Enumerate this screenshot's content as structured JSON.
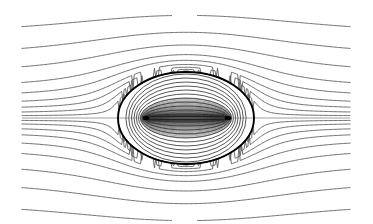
{
  "figure": {
    "title": "",
    "caption": "",
    "background_color": "#ffffff",
    "width": 373,
    "height": 224
  },
  "chart_data": {
    "type": "line",
    "title": "",
    "subtitle": "",
    "xlabel": "",
    "ylabel": "",
    "grid": false,
    "legend": null,
    "annotations": [],
    "xlim": [
      0,
      373
    ],
    "ylim": [
      0,
      224
    ],
    "geometry": {
      "plot_area": {
        "x": 22,
        "y": 25,
        "width": 328,
        "height": 174
      },
      "center": {
        "x": 186,
        "y": 118
      },
      "boundary_circle": {
        "cx": 186,
        "cy": 118,
        "rx": 68,
        "ry": 46,
        "stroke": "#000000",
        "stroke_width": 1.9
      },
      "foci": [
        {
          "x": 146,
          "y": 118
        },
        {
          "x": 228,
          "y": 118
        }
      ],
      "focal_half_separation": 41,
      "axis_of_symmetry_y": 118
    },
    "colors": {
      "stream_line": "#555555",
      "inner_contour": "#2b2b2b",
      "inner_dense": "#1a1a1a",
      "axis_line": "#777777",
      "boundary": "#000000",
      "background": "#ffffff"
    },
    "series": [
      {
        "name": "outer-streamlines-upper",
        "role": "streamline",
        "count": 9,
        "inlet_y": [
          36,
          57,
          74,
          88,
          97,
          104,
          109,
          113,
          116
        ],
        "note": "Streamlines approaching from the left at these heights, deflected upward over the obstacle and returning to the same height downstream."
      },
      {
        "name": "outer-streamlines-lower",
        "role": "streamline",
        "count": 9,
        "inlet_y": [
          200,
          179,
          162,
          148,
          139,
          132,
          127,
          123,
          120
        ],
        "note": "Mirror image of upper streamlines, deflected downward beneath the obstacle."
      },
      {
        "name": "axis-streamline",
        "role": "stagnation-streamline",
        "count": 1,
        "inlet_y": [
          118
        ],
        "note": "Centerline streamline through both stagnation points."
      },
      {
        "name": "inner-ellipses",
        "role": "confocal-contour",
        "count": 11,
        "semi_minor_b": [
          4,
          8,
          12,
          16,
          20,
          24,
          28,
          32,
          36,
          40,
          44
        ],
        "note": "Nested confocal ellipses sharing the two foci; outermost nearly coincides with the bold circle."
      },
      {
        "name": "inner-dense-lens",
        "role": "dense-contour-bundle",
        "count": 26,
        "semi_minor_b_min": 0.8,
        "semi_minor_b_max": 20,
        "note": "Very dense bundle of flattened confocal ellipses forming the dark lens between the two foci."
      }
    ]
  },
  "elements": {
    "boundary_label": "circular obstacle boundary",
    "focus_left_label": "left focal point",
    "focus_right_label": "right focal point",
    "axis_label": "horizontal symmetry axis"
  }
}
